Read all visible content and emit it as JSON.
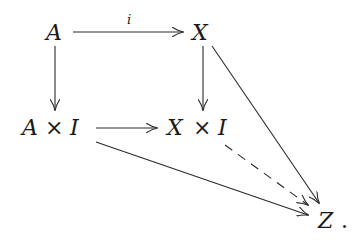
{
  "diagram": {
    "type": "commutative-diagram",
    "nodes": {
      "A": {
        "label": "A"
      },
      "X": {
        "label": "X"
      },
      "AxI": {
        "label_left": "A",
        "op": "×",
        "label_right": "I"
      },
      "XxI": {
        "label_left": "X",
        "op": "×",
        "label_right": "I"
      },
      "Z": {
        "label": "Z",
        "punct": "."
      }
    },
    "edges": [
      {
        "from": "A",
        "to": "X",
        "label": "i",
        "style": "solid"
      },
      {
        "from": "A",
        "to": "A×I",
        "label": "",
        "style": "solid"
      },
      {
        "from": "X",
        "to": "X×I",
        "label": "",
        "style": "solid"
      },
      {
        "from": "A×I",
        "to": "X×I",
        "label": "",
        "style": "solid"
      },
      {
        "from": "X",
        "to": "Z",
        "label": "",
        "style": "solid"
      },
      {
        "from": "A×I",
        "to": "Z",
        "label": "",
        "style": "solid"
      },
      {
        "from": "X×I",
        "to": "Z",
        "label": "",
        "style": "dashed"
      }
    ],
    "edge_label_i": "i"
  }
}
